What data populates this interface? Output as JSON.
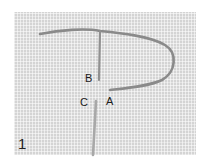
{
  "figure": {
    "step_number": "1",
    "labels": {
      "b": "B",
      "c": "C",
      "a": "A"
    },
    "colors": {
      "fabric": "#d4d4d4",
      "thread": "#8a8a8a",
      "needle": "#a8a8a8",
      "label_text": "#1a1a1a"
    }
  }
}
